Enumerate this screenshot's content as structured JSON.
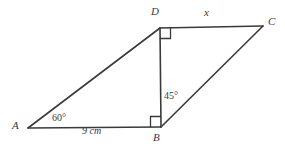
{
  "figure": {
    "canvas": {
      "width": 285,
      "height": 147
    },
    "stroke_color": "#3a3a3a",
    "text_color": "#3a3a3a",
    "background_color": "#ffffff",
    "vertices": [
      {
        "name": "A",
        "label": "A",
        "x": 28,
        "y": 128,
        "label_x": 12,
        "label_y": 121
      },
      {
        "name": "B",
        "label": "B",
        "x": 161,
        "y": 127,
        "label_x": 154,
        "label_y": 133
      },
      {
        "name": "C",
        "label": "C",
        "x": 263,
        "y": 26,
        "label_x": 268,
        "label_y": 17
      },
      {
        "name": "D",
        "label": "D",
        "x": 160,
        "y": 28,
        "label_x": 151,
        "label_y": 7
      }
    ],
    "segments": [
      {
        "name": "segment-AD",
        "from": "A",
        "to": "D"
      },
      {
        "name": "segment-AB",
        "from": "A",
        "to": "B"
      },
      {
        "name": "segment-DB",
        "from": "D",
        "to": "B"
      },
      {
        "name": "segment-DC",
        "from": "D",
        "to": "C"
      },
      {
        "name": "segment-BC",
        "from": "B",
        "to": "C"
      }
    ],
    "right_angle_markers": [
      {
        "name": "right-angle-at-D",
        "vertex": "D",
        "x": 160,
        "y": 28,
        "size": 10,
        "dir_x": 1,
        "dir_y": 1
      },
      {
        "name": "right-angle-at-B",
        "vertex": "B",
        "x": 161,
        "y": 127,
        "size": 10,
        "dir_x": -1,
        "dir_y": -1
      }
    ],
    "annotations": {
      "angle_A": {
        "text": "60°",
        "x": 52,
        "y": 114
      },
      "angle_B_interior": {
        "text": "45°",
        "x": 164,
        "y": 92
      },
      "side_AB_length": {
        "text": "9 cm",
        "x": 82,
        "y": 127
      },
      "side_DC_unknown": {
        "text": "x",
        "x": 204,
        "y": 8
      }
    }
  }
}
